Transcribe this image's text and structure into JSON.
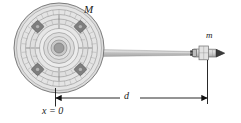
{
  "figure": {
    "labels": {
      "station_mass": "M",
      "craft_mass": "m",
      "distance": "d",
      "origin": "x = 0"
    },
    "colors": {
      "outline": "#6e6e6e",
      "station_fill": "#d8d8d8",
      "station_ring_light": "#e8e8e8",
      "station_ring_mid": "#cfcfcf",
      "hub_core": "#9a9a9a",
      "module_dark": "#7a7a7a",
      "beam": "#c4c4c4",
      "craft_fill": "#dcdcdc",
      "dimension_line": "#111111",
      "text": "#1a1a1a",
      "background": "#ffffff"
    },
    "geometry": {
      "station_center_x": 59,
      "station_center_y": 48,
      "station_radius": 45,
      "craft_center_x": 208,
      "craft_center_y": 53,
      "dimension_y": 98,
      "dimension_left_x": 55,
      "dimension_right_x": 208
    },
    "elements": {
      "station_name": "space-station",
      "craft_name": "spacecraft",
      "beam_name": "docking-beam",
      "dimension_name": "distance-dimension"
    }
  }
}
